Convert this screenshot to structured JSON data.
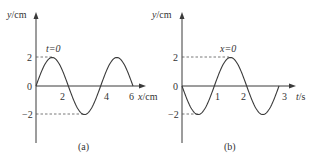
{
  "chart_data": [
    {
      "type": "line",
      "panel_label": "(a)",
      "title": "Waveform at t=0",
      "annotation": "t=0",
      "xlabel": "x/cm",
      "ylabel": "y/cm",
      "x_ticks": [
        "2",
        "4",
        "6"
      ],
      "y_ticks": [
        "2",
        "0",
        "-2"
      ],
      "xlim": [
        0,
        6.6
      ],
      "ylim": [
        -2,
        2
      ],
      "grid": false,
      "function": "y = 2*sin(2*pi*x/4)",
      "amplitude": 2,
      "period": 4,
      "x": [
        0,
        0.5,
        1,
        1.5,
        2,
        2.5,
        3,
        3.5,
        4,
        4.5,
        5,
        5.5,
        6
      ],
      "y": [
        0,
        1.41,
        2,
        1.41,
        0,
        -1.41,
        -2,
        -1.41,
        0,
        1.41,
        2,
        1.41,
        0
      ]
    },
    {
      "type": "line",
      "panel_label": "(b)",
      "title": "Vibration of particle at x=0",
      "annotation": "x=0",
      "xlabel": "t/s",
      "ylabel": "y/cm",
      "x_ticks": [
        "1",
        "2",
        "3"
      ],
      "y_ticks": [
        "2",
        "0",
        "-2"
      ],
      "xlim": [
        0,
        3.3
      ],
      "ylim": [
        -2,
        2
      ],
      "grid": false,
      "function": "y = -2*sin(2*pi*t/2)",
      "amplitude": 2,
      "period": 2,
      "x": [
        0,
        0.25,
        0.5,
        0.75,
        1,
        1.25,
        1.5,
        1.75,
        2,
        2.25,
        2.5,
        2.75,
        3
      ],
      "y": [
        0,
        -1.41,
        -2,
        -1.41,
        0,
        1.41,
        2,
        1.41,
        0,
        -1.41,
        -2,
        -1.41,
        0
      ]
    }
  ],
  "panels": {
    "a": {
      "ylabel": "y/cm",
      "xlabel": "x/cm",
      "annotation": "t=0",
      "origin": "0",
      "y_pos": "2",
      "y_neg": "−2",
      "x_ticks": [
        "2",
        "4",
        "6"
      ],
      "caption": "(a)"
    },
    "b": {
      "ylabel": "y/cm",
      "xlabel": "t/s",
      "annotation": "x=0",
      "origin": "0",
      "y_pos": "2",
      "y_neg": "−2",
      "x_ticks": [
        "1",
        "2",
        "3"
      ],
      "caption": "(b)"
    }
  }
}
